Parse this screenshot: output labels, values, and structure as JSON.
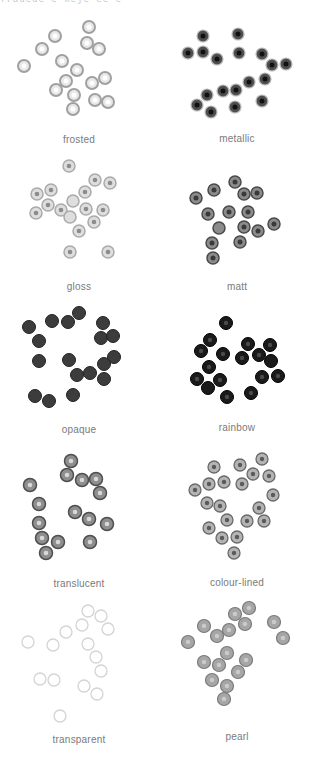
{
  "header": {
    "clipped_text": "fradede e keje ee  e"
  },
  "swatches": [
    {
      "label": "frosted",
      "bead_fill": "#e6e6e6",
      "bead_ring": "#9a9a9a",
      "hole": "#ffffff",
      "style": "frosted"
    },
    {
      "label": "metallic",
      "bead_fill": "#5a5a5a",
      "bead_ring": "#2a2a2a",
      "hole": "#111111",
      "style": "metallic"
    },
    {
      "label": "gloss",
      "bead_fill": "#dcdcdc",
      "bead_ring": "#a8a8a8",
      "hole": "#8c8c8c",
      "style": "gloss"
    },
    {
      "label": "matt",
      "bead_fill": "#8a8a8a",
      "bead_ring": "#4a4a4a",
      "hole": "#3a3a3a",
      "style": "matt"
    },
    {
      "label": "opaque",
      "bead_fill": "#3c3c3c",
      "bead_ring": "#252525",
      "hole": "#2e2e2e",
      "style": "opaque"
    },
    {
      "label": "rainbow",
      "bead_fill": "#1e1e1e",
      "bead_ring": "#0a0a0a",
      "hole": "#3a3a3a",
      "style": "rainbow"
    },
    {
      "label": "translucent",
      "bead_fill": "#8e8e8e",
      "bead_ring": "#4e4e4e",
      "hole": "#d8d8d8",
      "style": "translucent"
    },
    {
      "label": "colour-lined",
      "bead_fill": "#b4b4b4",
      "bead_ring": "#6a6a6a",
      "hole": "#5a5a5a",
      "style": "colour-lined"
    },
    {
      "label": "transparent",
      "bead_fill": "#fafafa",
      "bead_ring": "#d0d0d0",
      "hole": "#ffffff",
      "style": "transparent"
    },
    {
      "label": "pearl",
      "bead_fill": "#a8a8a8",
      "bead_ring": "#7a7a7a",
      "hole": "#c8c8c8",
      "style": "pearl"
    }
  ]
}
